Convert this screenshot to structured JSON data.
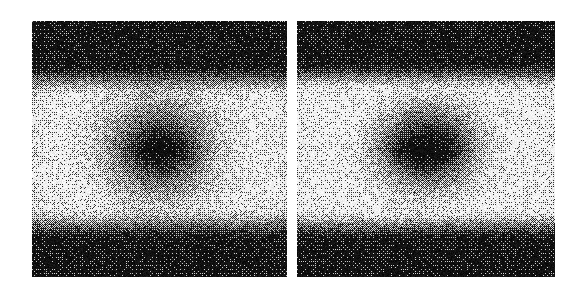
{
  "figure": {
    "title": "",
    "background_color": "#ffffff",
    "width": 582,
    "height": 295,
    "panel_count": 2,
    "render_type": "dithered-grayscale-speckle-scan",
    "caption": ""
  },
  "panels": [
    {
      "id": "left-panel",
      "label": "",
      "x": 32,
      "y": 21,
      "width": 255,
      "height": 256,
      "frame_color": "#000000",
      "description": "dark horizontal bands top and bottom, bright horizontal band across the middle, dark circular blob at center with very dark elongated horizontal core",
      "field": {
        "band_top_dark": {
          "y_start": 0.0,
          "y_end": 0.17,
          "level": 0.07
        },
        "band_top_gradient": {
          "y_start": 0.17,
          "y_end": 0.3,
          "level_from": 0.07,
          "level_to": 0.93
        },
        "band_bright": {
          "y_start": 0.3,
          "y_end": 0.72,
          "level": 0.93
        },
        "band_bottom_gradient": {
          "y_start": 0.72,
          "y_end": 0.86,
          "level_from": 0.93,
          "level_to": 0.07
        },
        "band_bottom_dark": {
          "y_start": 0.86,
          "y_end": 1.0,
          "level": 0.07
        },
        "blob": {
          "cx": 0.5,
          "cy": 0.5,
          "rx": 0.255,
          "ry": 0.235,
          "depth": 0.92,
          "falloff": 2.0
        },
        "core": {
          "cx": 0.505,
          "cy": 0.505,
          "rx": 0.115,
          "ry": 0.048,
          "depth": 1.0
        },
        "edge_vignette": 0.12,
        "noise_amount": 0.52,
        "dither_scale": 1
      }
    },
    {
      "id": "right-panel",
      "label": "",
      "x": 297,
      "y": 21,
      "width": 258,
      "height": 256,
      "frame_color": "#000000",
      "description": "same banded structure; central dark blob is more compact and horizontally elongated, surrounded by a brighter ring",
      "field": {
        "band_top_dark": {
          "y_start": 0.0,
          "y_end": 0.16,
          "level": 0.07
        },
        "band_top_gradient": {
          "y_start": 0.16,
          "y_end": 0.28,
          "level_from": 0.07,
          "level_to": 0.95
        },
        "band_bright": {
          "y_start": 0.28,
          "y_end": 0.73,
          "level": 0.95
        },
        "band_bottom_gradient": {
          "y_start": 0.73,
          "y_end": 0.86,
          "level_from": 0.95,
          "level_to": 0.07
        },
        "band_bottom_dark": {
          "y_start": 0.86,
          "y_end": 1.0,
          "level": 0.07
        },
        "blob": {
          "cx": 0.505,
          "cy": 0.495,
          "rx": 0.235,
          "ry": 0.205,
          "depth": 0.94,
          "falloff": 2.3
        },
        "core": {
          "cx": 0.495,
          "cy": 0.505,
          "rx": 0.13,
          "ry": 0.05,
          "depth": 1.0
        },
        "edge_vignette": 0.1,
        "noise_amount": 0.52,
        "dither_scale": 1
      }
    }
  ],
  "chart_data": {
    "type": "heatmap",
    "title": "",
    "subtitle": "",
    "xlabel": "",
    "ylabel": "",
    "grid": false,
    "legend_position": "none",
    "colormap": "grayscale",
    "value_range": [
      0,
      1
    ],
    "panel_labels": [
      "",
      ""
    ],
    "series": [
      {
        "name": "left-panel",
        "note": "intensity map: vertical banded background (dark-bright-dark) with central dark ellipse",
        "profile_vertical_normalized": {
          "y": [
            0.0,
            0.1,
            0.17,
            0.22,
            0.26,
            0.3,
            0.4,
            0.5,
            0.6,
            0.7,
            0.76,
            0.82,
            0.88,
            0.95,
            1.0
          ],
          "intensity": [
            0.07,
            0.07,
            0.09,
            0.3,
            0.62,
            0.9,
            0.93,
            0.93,
            0.93,
            0.93,
            0.72,
            0.36,
            0.1,
            0.07,
            0.07
          ]
        },
        "profile_horizontal_center_normalized": {
          "x": [
            0.0,
            0.08,
            0.16,
            0.24,
            0.3,
            0.38,
            0.44,
            0.5,
            0.56,
            0.62,
            0.7,
            0.76,
            0.84,
            0.92,
            1.0
          ],
          "intensity": [
            0.92,
            0.93,
            0.9,
            0.72,
            0.48,
            0.22,
            0.08,
            0.03,
            0.08,
            0.22,
            0.48,
            0.72,
            0.9,
            0.93,
            0.92
          ]
        }
      },
      {
        "name": "right-panel",
        "note": "intensity map: same banding, tighter and more elongated central dark ellipse",
        "profile_vertical_normalized": {
          "y": [
            0.0,
            0.1,
            0.16,
            0.21,
            0.25,
            0.28,
            0.4,
            0.5,
            0.6,
            0.7,
            0.77,
            0.82,
            0.88,
            0.95,
            1.0
          ],
          "intensity": [
            0.07,
            0.07,
            0.1,
            0.34,
            0.68,
            0.95,
            0.95,
            0.95,
            0.95,
            0.95,
            0.7,
            0.34,
            0.1,
            0.07,
            0.07
          ]
        },
        "profile_horizontal_center_normalized": {
          "x": [
            0.0,
            0.08,
            0.16,
            0.24,
            0.3,
            0.38,
            0.44,
            0.5,
            0.56,
            0.62,
            0.7,
            0.76,
            0.84,
            0.92,
            1.0
          ],
          "intensity": [
            0.94,
            0.95,
            0.93,
            0.8,
            0.58,
            0.26,
            0.07,
            0.02,
            0.07,
            0.26,
            0.58,
            0.8,
            0.93,
            0.95,
            0.94
          ]
        }
      }
    ]
  }
}
